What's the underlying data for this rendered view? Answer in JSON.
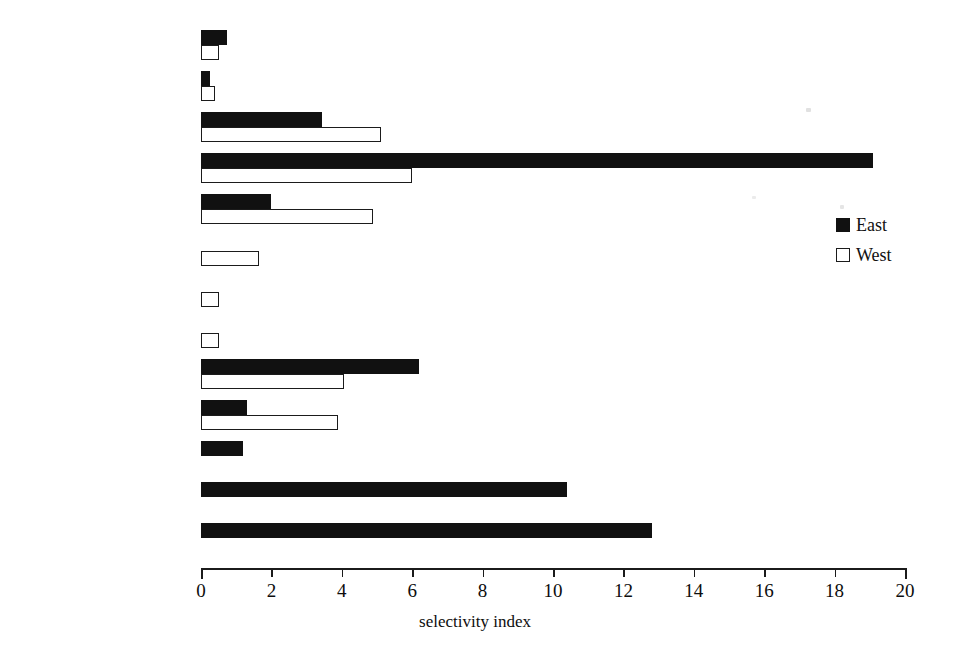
{
  "chart_data": {
    "type": "bar",
    "orientation": "horizontal",
    "title": "",
    "xlabel": "selectivity index",
    "ylabel": "",
    "xlim": [
      0,
      20
    ],
    "xticks": [
      0,
      2,
      4,
      6,
      8,
      10,
      12,
      14,
      16,
      18,
      20
    ],
    "grid": false,
    "legend_position": "right",
    "categories": [
      "B. alicastrum (F)",
      "B. alicastrum (L)",
      "F. ovalis",
      "F. cotinifolia",
      "M. zapota",
      "M. brownei",
      "P. copal",
      "\"botox\"",
      "G. ulmifolia",
      "S. capiri",
      "S. mombin",
      "E. cyclocarpum (F)",
      "E. cyclocarpum (L)"
    ],
    "series": [
      {
        "name": "East",
        "color": "#111111",
        "values": [
          0.75,
          0.25,
          3.45,
          19.1,
          2.0,
          0,
          0,
          0,
          6.2,
          1.3,
          1.2,
          10.4,
          12.8
        ]
      },
      {
        "name": "West",
        "color": "#ffffff",
        "values": [
          0.5,
          0.2,
          5.1,
          6.0,
          4.9,
          1.65,
          0.5,
          0.5,
          4.05,
          3.9,
          0,
          0,
          0
        ]
      }
    ]
  },
  "legend": {
    "items": [
      {
        "label": "East",
        "swatch": "filled-square-icon"
      },
      {
        "label": "West",
        "swatch": "outlined-square-icon"
      }
    ]
  },
  "axis": {
    "title": "selectivity index"
  }
}
